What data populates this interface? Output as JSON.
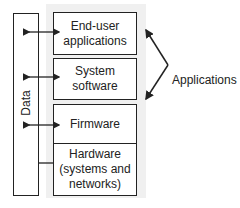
{
  "diagram": {
    "layers": [
      {
        "label": "End-user applications",
        "line1": "End-user",
        "line2": "applications",
        "connection": "bidirectional-arrow"
      },
      {
        "label": "System software",
        "line1": "System",
        "line2": "software",
        "connection": "bidirectional-arrow"
      },
      {
        "label": "Firmware",
        "line1": "Firmware",
        "connection": "bidirectional-arrow"
      },
      {
        "label": "Hardware (systems and networks)",
        "line1": "Hardware",
        "line2": "(systems and",
        "line3": "networks)",
        "connection": "line"
      }
    ],
    "side_column": {
      "label": "Data"
    },
    "bracket": {
      "label": "Applications",
      "spans": [
        "End-user applications",
        "System software"
      ]
    }
  }
}
